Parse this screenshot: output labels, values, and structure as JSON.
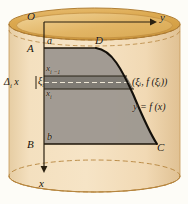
{
  "figure": {
    "colors": {
      "page_background": "#fdfcf7",
      "cylinder_body": "#f2dcb8",
      "cylinder_body_shade": "#e8cda4",
      "cylinder_top_ellipse": "#dda94f",
      "cylinder_top_ellipse_light": "#edcb8a",
      "outline": "#b98a43",
      "dashed_outline": "#b0813c",
      "region_fill": "#9a958e",
      "strip_fill": "#7f7b74",
      "curve_stroke": "#1c1408",
      "axis_stroke": "#2a2010",
      "text": "#1a1208"
    },
    "geometry": {
      "cylinder_left": 9,
      "cylinder_right": 180,
      "cylinder_top_center_y": 24,
      "cylinder_bottom_center_y": 176,
      "ellipse_rx": 85,
      "ellipse_ry": 16,
      "origin": [
        44,
        22
      ],
      "y_axis_end": [
        152,
        22
      ],
      "x_axis_end": [
        44,
        168
      ],
      "top_edge_y": 48,
      "bottom_edge_y": 144,
      "strip_top_y": 76,
      "strip_bottom_y": 89,
      "xi_dash_y": 82,
      "point_D": [
        96,
        48
      ],
      "point_C": [
        157,
        144
      ]
    }
  },
  "labels": {
    "origin": "O",
    "y_axis": "y",
    "x_axis": "x",
    "point_A": "A",
    "point_B": "B",
    "point_C": "C",
    "point_D": "D",
    "bound_a": "a",
    "bound_b": "b",
    "x_sub_i_minus_1": "x",
    "x_sub_i_minus_1_sub": "i −1",
    "x_sub_i": "x",
    "x_sub_i_sub": "i",
    "delta_i_x": "Δ",
    "delta_i_x_sub": "i",
    "delta_i_x_tail": " x",
    "xi_i": "ξ",
    "xi_i_sub": "i",
    "point_on_curve": "(ξᵢ, f (ξᵢ))",
    "curve_equation": "y = f (x)"
  }
}
